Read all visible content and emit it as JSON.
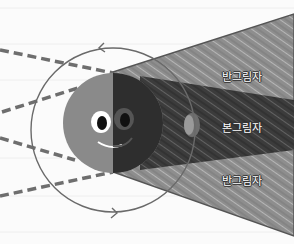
{
  "diagram": {
    "labels": {
      "penumbra_top": "반그림자",
      "umbra": "본그림자",
      "penumbra_bottom": "반그림자"
    },
    "elements": {
      "earth": "smiling earth, half lit / half dark",
      "orbit": "moon orbit circle with counter-clockwise arrows",
      "sun_rays": "dashed lines converging from left",
      "moon": "small moon inside umbra"
    },
    "colors": {
      "background": "#fbfbfb",
      "penumbra": "#8c8c8c",
      "umbra": "#3a3a3a",
      "earth_lit": "#8a8a8a",
      "earth_dark": "#2e2e2e",
      "rays": "#6e6e6e",
      "orbit": "#6a6a6a"
    }
  }
}
